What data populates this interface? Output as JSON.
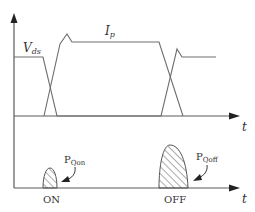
{
  "diagram": {
    "type": "mosfet-switching-waveform",
    "upper_plot": {
      "voltage_label": "V",
      "voltage_subscript": "ds",
      "current_label": "I",
      "current_subscript": "p",
      "time_axis_label": "t"
    },
    "lower_plot": {
      "on_loss_label": "P",
      "on_loss_subscript": "Qon",
      "off_loss_label": "P",
      "off_loss_subscript": "Qoff",
      "on_event_label": "ON",
      "off_event_label": "OFF",
      "time_axis_label": "t"
    },
    "colors": {
      "line": "#6e6e6e",
      "axis": "#5a5a5a",
      "text": "#333333",
      "arrow": "#222222"
    }
  }
}
